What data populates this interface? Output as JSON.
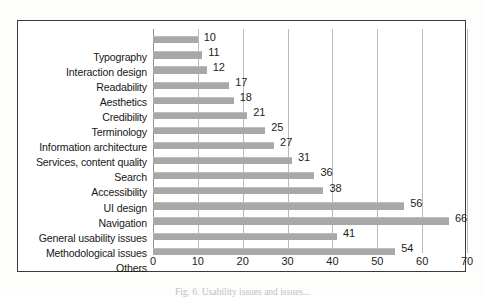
{
  "chart_data": {
    "type": "bar",
    "orientation": "horizontal",
    "title": "",
    "xlabel": "",
    "ylabel": "",
    "xlim": [
      0,
      70
    ],
    "xticks": [
      0,
      10,
      20,
      30,
      40,
      50,
      60,
      70
    ],
    "grid": true,
    "legend": false,
    "bar_color": "#a8a8a8",
    "categories": [
      "Typography",
      "Interaction design",
      "Readability",
      "Aesthetics",
      "Credibility",
      "Terminology",
      "Information architecture",
      "Services, content quality",
      "Search",
      "Accessibility",
      "UI design",
      "Navigation",
      "General usability issues",
      "Methodological issues",
      "Others"
    ],
    "values": [
      10,
      11,
      12,
      17,
      18,
      21,
      25,
      27,
      31,
      36,
      38,
      56,
      66,
      41,
      54
    ],
    "data_labels": [
      "10",
      "11",
      "12",
      "17",
      "18",
      "21",
      "25",
      "27",
      "31",
      "36",
      "38",
      "56",
      "66",
      "41",
      "54"
    ],
    "xtick_labels": [
      "0",
      "10",
      "20",
      "30",
      "40",
      "50",
      "60",
      "70"
    ]
  },
  "figure": {
    "caption": "Fig. 6.  Usability issues and issues...",
    "border_color": "#3a3a3a",
    "background": "#ffffff"
  }
}
